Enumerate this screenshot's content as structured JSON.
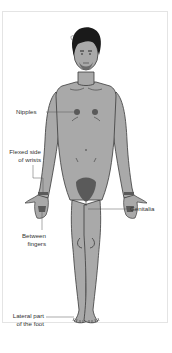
{
  "diagram": {
    "colors": {
      "skin": "#a9a9a9",
      "outline": "#3a3a3a",
      "hair": "#1a1a1a",
      "highlight_region": "#5a5a5a",
      "leader_line": "#555555",
      "label_text": "#333333",
      "frame_border": "#e4e4e4",
      "background": "#ffffff"
    },
    "labels": [
      {
        "id": "nipples",
        "text": "Nipples",
        "side": "left"
      },
      {
        "id": "wrists",
        "line1": "Flexed side",
        "line2": "of wrists",
        "side": "left"
      },
      {
        "id": "genitalia",
        "text": "Genitalia",
        "side": "right"
      },
      {
        "id": "fingers",
        "line1": "Between",
        "line2": "fingers",
        "side": "left"
      },
      {
        "id": "foot",
        "line1": "Lateral part",
        "line2": "of the foot",
        "side": "left"
      }
    ]
  }
}
